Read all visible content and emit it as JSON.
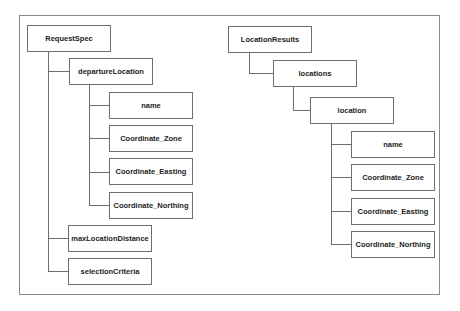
{
  "diagram": {
    "type": "tree-hierarchy",
    "left_tree": {
      "root": "RequestSpec",
      "children": [
        {
          "label": "departureLocation",
          "children": [
            {
              "label": "name"
            },
            {
              "label": "Coordinate_Zone"
            },
            {
              "label": "Coordinate_Easting"
            },
            {
              "label": "Coordinate_Northing"
            }
          ]
        },
        {
          "label": "maxLocationDistance"
        },
        {
          "label": "selectionCriteria"
        }
      ]
    },
    "right_tree": {
      "root": "LocationResults",
      "children": [
        {
          "label": "locations",
          "children": [
            {
              "label": "location",
              "children": [
                {
                  "label": "name"
                },
                {
                  "label": "Coordinate_Zone"
                },
                {
                  "label": "Coordinate_Easting"
                },
                {
                  "label": "Coordinate_Northing"
                }
              ]
            }
          ]
        }
      ]
    },
    "colors": {
      "line": "#6e6e6e",
      "frame": "#8a8a8a",
      "text": "#222222",
      "background": "#ffffff"
    }
  }
}
